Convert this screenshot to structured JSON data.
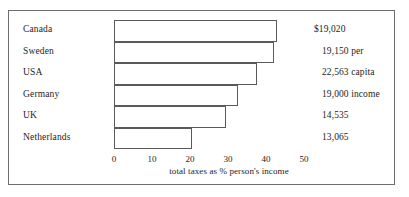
{
  "chart_data": {
    "type": "bar",
    "orientation": "horizontal",
    "title": "",
    "xlabel": "total taxes as % person's income",
    "ylabel": "",
    "xlim": [
      0,
      50
    ],
    "xticks": [
      0,
      10,
      20,
      30,
      40,
      50
    ],
    "xtick_labels": [
      "0",
      "10",
      "20",
      "30",
      "40",
      "50"
    ],
    "grid": false,
    "legend": null,
    "categories": [
      "Canada",
      "Sweden",
      "USA",
      "Germany",
      "UK",
      "Netherlands"
    ],
    "values": [
      43,
      42,
      37.5,
      32.5,
      29.5,
      20.5
    ],
    "annotations": [
      "$19,020",
      "19,150 per",
      "22,563 capita",
      "19,000 income",
      "14,535",
      "13,065"
    ],
    "bars": [
      {
        "category": "Canada",
        "value": 43,
        "annotation": "$19,020",
        "annotation_indent": 0
      },
      {
        "category": "Sweden",
        "value": 42,
        "annotation": "19,150 per",
        "annotation_indent": 8
      },
      {
        "category": "USA",
        "value": 37.5,
        "annotation": "22,563 capita",
        "annotation_indent": 8
      },
      {
        "category": "Germany",
        "value": 32.5,
        "annotation": "19,000 income",
        "annotation_indent": 8
      },
      {
        "category": "UK",
        "value": 29.5,
        "annotation": "14,535",
        "annotation_indent": 8
      },
      {
        "category": "Netherlands",
        "value": 20.5,
        "annotation": "13,065",
        "annotation_indent": 8
      }
    ]
  },
  "colors": {
    "frame": "#6e6e6e",
    "bar_outline": "#5a5a5a",
    "bar_fill": "#ffffff",
    "text": "#1d1d1d",
    "background": "#ffffff"
  }
}
